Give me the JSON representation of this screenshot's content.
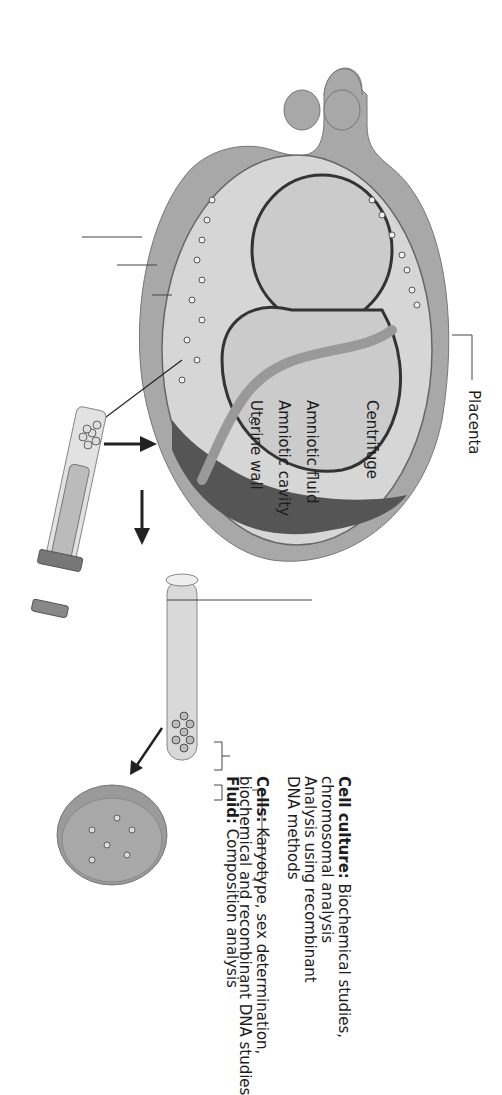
{
  "figure": {
    "orientation": "rotated 90 degrees clockwise"
  },
  "anatomy_labels": {
    "placenta": "Placenta",
    "amniotic_fluid": "Amniotic fluid",
    "amniotic_cavity": "Amniotic cavity",
    "uterine_wall": "Uterine wall"
  },
  "process": {
    "centrifuge": "Centrifuge"
  },
  "results": {
    "fluid": {
      "title": "Fluid:",
      "text": "Composition analysis"
    },
    "cells": {
      "title": "Cells:",
      "line1": "Karyotype, sex determination,",
      "line2": "biochemical and recombinant DNA studies"
    },
    "cell_culture": {
      "title": "Cell culture:",
      "line1": "Biochemical studies,",
      "line2": "chromosomal analysis",
      "line3": "Analysis using recombinant",
      "line4": "DNA methods"
    }
  },
  "colors": {
    "uterus": "#a8a8a8",
    "fluid": "#d4d4d4",
    "fetus": "#c9c9c9",
    "outline": "#3a3a3a",
    "placenta": "#555555",
    "dish": "#9a9a9a"
  }
}
